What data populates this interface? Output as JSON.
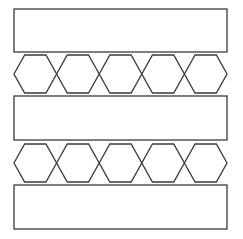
{
  "diagram": {
    "background": "#ffffff",
    "stroke_color": "#3a3a3a",
    "stroke_width": 1.3,
    "rectangles": [
      {
        "name": "rectangle-top",
        "x": 14,
        "y": 9,
        "w": 213,
        "h": 43
      },
      {
        "name": "rectangle-middle",
        "x": 14,
        "y": 96,
        "w": 213,
        "h": 44
      },
      {
        "name": "rectangle-bottom",
        "x": 14,
        "y": 185,
        "w": 213,
        "h": 44
      }
    ],
    "hexagon_rows": [
      {
        "name": "hexagon-row-1",
        "cy": 74,
        "count": 5
      },
      {
        "name": "hexagon-row-2",
        "cy": 163,
        "count": 5
      }
    ],
    "hexagon": {
      "start_x": 14,
      "width": 42.6,
      "height": 38
    }
  }
}
